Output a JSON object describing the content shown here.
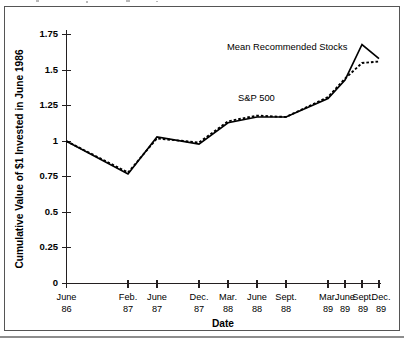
{
  "chart_data": {
    "type": "line",
    "title": "",
    "xlabel": "Date",
    "ylabel": "Cumulative Value of $1 Invested in June 1986",
    "categories": [
      "June 86",
      "Feb. 87",
      "June 87",
      "Dec. 87",
      "Mar. 88",
      "June 88",
      "Sept. 88",
      "Mar. 89",
      "June 89",
      "Sept. 89",
      "Dec. 89"
    ],
    "x_tick_labels": [
      {
        "month": "June",
        "year": "86"
      },
      {
        "month": "Feb.",
        "year": "87"
      },
      {
        "month": "June",
        "year": "87"
      },
      {
        "month": "Dec.",
        "year": "87"
      },
      {
        "month": "Mar.",
        "year": "88"
      },
      {
        "month": "June",
        "year": "88"
      },
      {
        "month": "Sept.",
        "year": "88"
      },
      {
        "month": "Mar.",
        "year": "89"
      },
      {
        "month": "June",
        "year": "89"
      },
      {
        "month": "Sept.",
        "year": "89"
      },
      {
        "month": "Dec.",
        "year": "89"
      }
    ],
    "y_tick_labels": [
      "0",
      "0.25",
      "0.5",
      "0.75",
      "1",
      "1.25",
      "1.5",
      "1.75"
    ],
    "y_tick_values": [
      0,
      0.25,
      0.5,
      0.75,
      1,
      1.25,
      1.5,
      1.75
    ],
    "ylim": [
      0,
      1.75
    ],
    "grid": false,
    "legend": "inline-annotations",
    "series": [
      {
        "name": "Mean Recommended Stocks",
        "style": "solid",
        "values": [
          1.0,
          0.77,
          1.03,
          0.98,
          1.13,
          1.17,
          1.17,
          1.3,
          1.43,
          1.68,
          1.58
        ]
      },
      {
        "name": "S&P 500",
        "style": "dashed",
        "values": [
          1.0,
          0.78,
          1.02,
          0.99,
          1.14,
          1.18,
          1.17,
          1.31,
          1.44,
          1.55,
          1.56
        ]
      }
    ],
    "annotations": [
      {
        "text": "Mean Recommended Stocks",
        "x": 0.7,
        "y": 1.62
      },
      {
        "text": "S&P 500",
        "x": 0.53,
        "y": 1.24
      }
    ],
    "colors": {
      "line": "#000000",
      "axis": "#231f20",
      "background": "#ffffff",
      "frame": "#555555"
    }
  }
}
